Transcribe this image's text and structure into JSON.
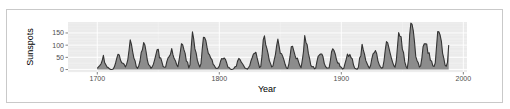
{
  "chart_data": {
    "type": "area",
    "title": "",
    "xlabel": "Year",
    "ylabel": "Sunspots",
    "xlim": [
      1676,
      2003
    ],
    "ylim": [
      -10,
      195
    ],
    "x_ticks": [
      1700,
      1800,
      1900,
      2000
    ],
    "y_ticks": [
      0,
      50,
      100,
      150
    ],
    "grid": true,
    "legend": null,
    "colors": {
      "panel_bg": "#ebebeb",
      "grid": "#ffffff",
      "fill": "#8c8c8c",
      "line": "#333333"
    },
    "x_start": 1700,
    "x_step": 1,
    "values": [
      5,
      11,
      16,
      23,
      36,
      58,
      29,
      20,
      10,
      8,
      3,
      0,
      0,
      2,
      11,
      27,
      47,
      63,
      60,
      39,
      28,
      26,
      22,
      11,
      21,
      40,
      78,
      122,
      103,
      73,
      47,
      35,
      11,
      5,
      16,
      34,
      70,
      81,
      111,
      101,
      73,
      40,
      20,
      16,
      5,
      11,
      22,
      40,
      60,
      80.9,
      83.4,
      47.7,
      47.8,
      30.7,
      12.2,
      9.6,
      10.2,
      32.4,
      47.6,
      54,
      62.9,
      85.9,
      61.2,
      45.1,
      36.4,
      20.9,
      11.4,
      37.8,
      69.8,
      106.1,
      100.8,
      81.6,
      66.5,
      34.8,
      30.6,
      7,
      19.8,
      92.5,
      154.4,
      125.9,
      84.8,
      68.1,
      38.5,
      22.8,
      10.2,
      24.1,
      82.9,
      132,
      130.9,
      118.1,
      89.9,
      66.6,
      60,
      46.9,
      41,
      21.3,
      16,
      6.4,
      4.1,
      6.8,
      14.5,
      34,
      45,
      43.1,
      47.5,
      42.2,
      28.1,
      10.1,
      8.1,
      2.5,
      0,
      1.4,
      5,
      12.2,
      13.9,
      35.4,
      45.8,
      41.1,
      30.1,
      23.9,
      15.6,
      6.6,
      4,
      1.8,
      8.5,
      16.6,
      36.3,
      49.6,
      64.2,
      67,
      70.9,
      47.8,
      27.5,
      8.5,
      13.2,
      56.9,
      121.5,
      138.3,
      103.2,
      85.7,
      64.6,
      36.7,
      24.2,
      10.7,
      15,
      40.1,
      61.5,
      98.5,
      124.7,
      96.3,
      66.6,
      64.5,
      54.1,
      39,
      20.6,
      6.7,
      4.3,
      22.7,
      54.8,
      93.8,
      95.8,
      77.2,
      59.1,
      44,
      47,
      30.5,
      16.3,
      7.3,
      37.6,
      74,
      139,
      111.2,
      101.6,
      66.2,
      44.7,
      17,
      11.3,
      12.4,
      3.4,
      6,
      32.3,
      54.3,
      59.7,
      63.7,
      63.5,
      52.2,
      25.4,
      13.1,
      6.8,
      6.3,
      7.1,
      35.6,
      73,
      85.1,
      78,
      64,
      41.8,
      26.2,
      26.7,
      12.1,
      9.5,
      2.7,
      5,
      24.4,
      42,
      63.5,
      53.8,
      62,
      48.5,
      43.9,
      18.6,
      5.7,
      3.6,
      1.4,
      9.6,
      47.4,
      57.1,
      103.9,
      80.6,
      63.6,
      37.6,
      26.1,
      14.2,
      5.8,
      16.7,
      44.3,
      63.9,
      69,
      77.8,
      64.9,
      35.7,
      21.2,
      11.1,
      5.7,
      8.7,
      36.1,
      79.7,
      114.4,
      109.6,
      88.8,
      67.8,
      47.5,
      30.6,
      16.3,
      9.6,
      33.2,
      92.6,
      151.6,
      136.3,
      134.7,
      83.9,
      69.4,
      31.5,
      13.9,
      4.4,
      38,
      141.7,
      190.2,
      184.8,
      159,
      112.3,
      53.9,
      37.6,
      27.9,
      10.2,
      15.1,
      47,
      93.8,
      105.9,
      105.5,
      104.5,
      66.6,
      68.9,
      38,
      34.5,
      15.5,
      12.6,
      27.5,
      92.5,
      155.4,
      154.6,
      140.5,
      115.9,
      66.6,
      45.9,
      17.9,
      13.4,
      29.2,
      100.2
    ]
  },
  "axes": {
    "x_title": "Year",
    "y_title": "Sunspots",
    "x_tick_labels": [
      "1700",
      "1800",
      "1900",
      "2000"
    ],
    "y_tick_labels": [
      "0",
      "50",
      "100",
      "150"
    ]
  }
}
